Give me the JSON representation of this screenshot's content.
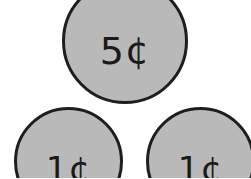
{
  "coins": [
    {
      "label": "5¢",
      "value_cents": 5,
      "position": "top-center"
    },
    {
      "label": "1¢",
      "value_cents": 1,
      "position": "bottom-left"
    },
    {
      "label": "1¢",
      "value_cents": 1,
      "position": "bottom-right"
    }
  ],
  "colors": {
    "coin_fill": "#b9b9b9",
    "coin_border": "#1e1e1e",
    "background": "#ffffff"
  }
}
